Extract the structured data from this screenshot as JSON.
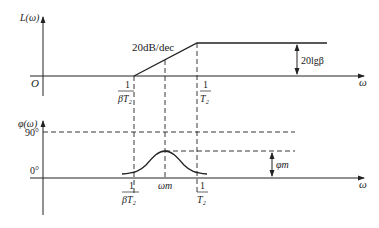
{
  "magnitude_plot": {
    "y_axis_label": "L(ω)",
    "origin_label": "O",
    "x_axis_label": "ω",
    "slope_label": "20dB/dec",
    "gain_label": "20lgβ",
    "break_low": {
      "num": "1",
      "den": "βT₂"
    },
    "break_high": {
      "num": "1",
      "den": "T₂"
    }
  },
  "phase_plot": {
    "y_axis_label": "φ(ω)",
    "tick_90": "90°",
    "tick_0": "0°",
    "x_axis_label": "ω",
    "peak_freq_label": "ωm",
    "peak_phase_label": "φm",
    "break_low": {
      "num": "1",
      "den": "βT₂"
    },
    "break_high": {
      "num": "1",
      "den": "T₂"
    }
  },
  "colors": {
    "line": "#222222",
    "background": "#ffffff"
  }
}
